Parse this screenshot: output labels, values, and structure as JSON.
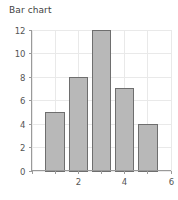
{
  "chart_data": {
    "type": "bar",
    "title": "Bar chart",
    "xlabel": "",
    "ylabel": "",
    "categories": [
      "1",
      "2",
      "3",
      "4",
      "5"
    ],
    "x": [
      1,
      2,
      3,
      4,
      5
    ],
    "values": [
      5,
      8,
      12,
      7,
      4
    ],
    "xlim": [
      0,
      6
    ],
    "ylim": [
      0,
      12
    ],
    "ytick_labels": [
      "0",
      "2",
      "4",
      "6",
      "8",
      "10",
      "12"
    ],
    "ytick_values": [
      0,
      2,
      4,
      6,
      8,
      10,
      12
    ],
    "xtick_values": [
      0,
      1,
      2,
      3,
      4,
      5,
      6
    ],
    "xtick_labels": [
      "",
      "",
      "2",
      "",
      "4",
      "",
      "6"
    ],
    "grid": true,
    "legend": false,
    "bar_fill_color": "#b8b8b8",
    "bar_border_color": "#6e6e6e",
    "grid_color": "#e9e9e9",
    "axis_color": "#9a9a9a",
    "title_color": "#3f3f3f",
    "background_color": "#ffffff"
  }
}
